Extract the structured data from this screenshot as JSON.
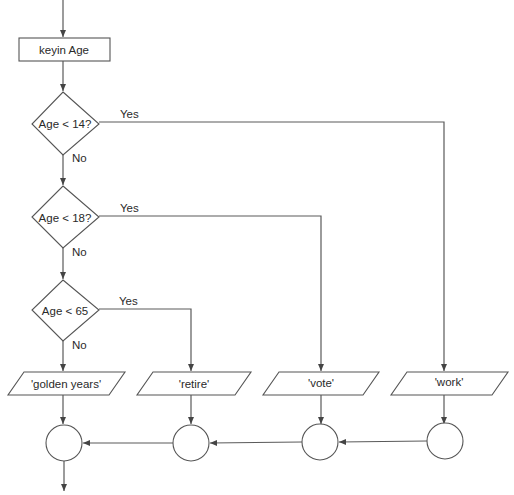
{
  "diagram": {
    "type": "flowchart",
    "process": {
      "label": "keyin Age"
    },
    "decisions": [
      {
        "label": "Age < 14?",
        "yes_label": "Yes",
        "no_label": "No"
      },
      {
        "label": "Age < 18?",
        "yes_label": "Yes",
        "no_label": "No"
      },
      {
        "label": "Age < 65",
        "yes_label": "Yes",
        "no_label": "No"
      }
    ],
    "outputs": [
      {
        "label": "'golden years'"
      },
      {
        "label": "'retire'"
      },
      {
        "label": "'vote'"
      },
      {
        "label": "'work'"
      }
    ],
    "connectors": 4,
    "colors": {
      "line": "#5a5a5a",
      "text": "#2a2a2a",
      "background": "#ffffff"
    }
  }
}
